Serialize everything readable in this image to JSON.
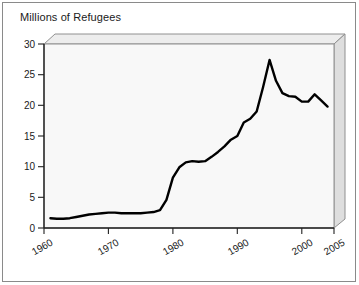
{
  "figure": {
    "title": "Millions of Refugees",
    "background_color": "#ffffff",
    "frame_color": "#8a8a8a",
    "panel_face_color": "#f7f7f7",
    "panel_side_color": "#e0e0e0",
    "panel_top_color": "#ededed",
    "line_color": "#000000"
  },
  "chart_data": {
    "type": "line",
    "title": "Millions of Refugees",
    "xlabel": "",
    "ylabel": "Millions of Refugees",
    "xlim": [
      1960,
      2005
    ],
    "ylim": [
      0,
      30
    ],
    "xticks": [
      1960,
      1970,
      1980,
      1990,
      2000,
      2005
    ],
    "xtick_labels": [
      "1960",
      "1970",
      "1980",
      "1990",
      "2000",
      "2005"
    ],
    "yticks": [
      0,
      5,
      10,
      15,
      20,
      25,
      30
    ],
    "ytick_labels": [
      "0",
      "5",
      "10",
      "15",
      "20",
      "25",
      "30"
    ],
    "grid": false,
    "legend": null,
    "legend_position": "none",
    "tick_label_rotation_x": -30,
    "series": [
      {
        "name": "Refugees",
        "x": [
          1961,
          1962,
          1963,
          1964,
          1965,
          1966,
          1967,
          1968,
          1969,
          1970,
          1971,
          1972,
          1973,
          1974,
          1975,
          1976,
          1977,
          1978,
          1979,
          1980,
          1981,
          1982,
          1983,
          1984,
          1985,
          1986,
          1987,
          1988,
          1989,
          1990,
          1991,
          1992,
          1993,
          1994,
          1995,
          1996,
          1997,
          1998,
          1999,
          2000,
          2001,
          2002,
          2003,
          2004
        ],
        "values": [
          1.6,
          1.5,
          1.5,
          1.6,
          1.8,
          2.0,
          2.2,
          2.3,
          2.4,
          2.5,
          2.5,
          2.4,
          2.4,
          2.4,
          2.4,
          2.5,
          2.6,
          2.9,
          4.6,
          8.2,
          9.9,
          10.7,
          10.9,
          10.8,
          10.9,
          11.6,
          12.4,
          13.3,
          14.4,
          15.0,
          17.2,
          17.8,
          19.0,
          23.0,
          27.4,
          24.0,
          22.0,
          21.5,
          21.4,
          20.6,
          20.6,
          21.8,
          20.8,
          19.8
        ]
      }
    ]
  },
  "axes": {
    "y_title": "Millions of Refugees",
    "x_tick_labels": [
      "1960",
      "1970",
      "1980",
      "1990",
      "2000",
      "2005"
    ],
    "y_tick_labels": [
      "0",
      "5",
      "10",
      "15",
      "20",
      "25",
      "30"
    ]
  }
}
